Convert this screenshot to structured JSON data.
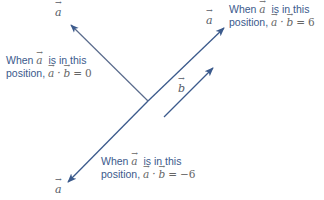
{
  "diagram": {
    "colors": {
      "arrow": "#3b5a8c",
      "text": "#3b5a8c",
      "vector_label": "#555a66"
    },
    "vector_labels": {
      "a_top_left": "a",
      "a_top_right": "a",
      "a_bottom_left": "a",
      "b": "b"
    },
    "annotations": [
      {
        "id": "perpendicular",
        "line1": "When a is in this",
        "line2": "position, a · b = 0",
        "result": "0"
      },
      {
        "id": "parallel",
        "line1": "When a is in this",
        "line2": "position, a · b = 6",
        "result": "6"
      },
      {
        "id": "antiparallel",
        "line1": "When a is in this",
        "line2": "position, a · b = −6",
        "result": "−6"
      }
    ],
    "text": {
      "when": "When",
      "is_in_this": "is in this",
      "position": "position,",
      "dot": "·",
      "eq": "=",
      "val_perp": "0",
      "val_par": "6",
      "val_anti": "−6"
    }
  }
}
